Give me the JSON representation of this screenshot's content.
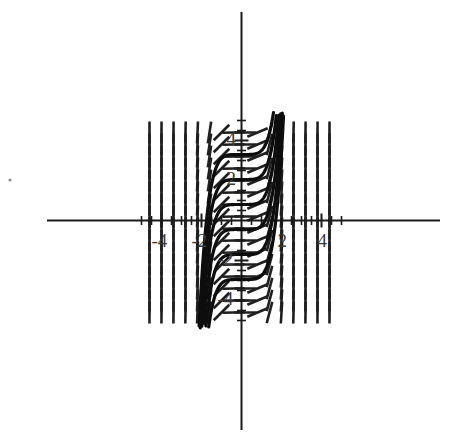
{
  "figure": {
    "title": "",
    "background_color": "#ffffff",
    "ink_color": "#1a1a1a",
    "curve_color": "#0d0d0d",
    "label_color": "#3a3a3a"
  },
  "chart_data": {
    "type": "line",
    "title": "",
    "subtitle": "",
    "xlabel": "",
    "ylabel": "",
    "xlim": [
      -5,
      5
    ],
    "ylim": [
      -5,
      5
    ],
    "grid": false,
    "legend": null,
    "legend_position": "none",
    "x_ticks_major": [
      -4,
      -2,
      2,
      4
    ],
    "x_tick_labels": [
      "-4",
      "-2",
      "2",
      "4"
    ],
    "y_ticks_major": [
      -4,
      -2,
      2,
      4
    ],
    "y_tick_labels": [
      "-4",
      "-2",
      "2",
      "4"
    ],
    "x_ticks_minor": [
      -5,
      -4.5,
      -4,
      -3.5,
      -3,
      -2.5,
      -2,
      -1.5,
      -1,
      -0.5,
      0.5,
      1,
      1.5,
      2,
      2.5,
      3,
      3.5,
      4,
      4.5,
      5
    ],
    "y_ticks_minor": [
      -5,
      -4.5,
      -4,
      -3.5,
      -3,
      -2.5,
      -2,
      -1.5,
      -1,
      -0.5,
      0.5,
      1,
      1.5,
      2,
      2.5,
      3,
      3.5,
      4,
      4.5,
      5
    ],
    "slope_rule": "dy/dx = x^4",
    "slope_field": {
      "x_samples": [
        -4.6,
        -4.0,
        -3.4,
        -2.8,
        -2.2,
        -1.6,
        -1.0,
        -0.4,
        0.2,
        0.8,
        1.4,
        2.0,
        2.6,
        3.2,
        3.8,
        4.4
      ],
      "y_samples": [
        -4.6,
        -4.0,
        -3.4,
        -2.8,
        -2.2,
        -1.6,
        -1.0,
        -0.4,
        0.2,
        0.8,
        1.4,
        2.0,
        2.6,
        3.2,
        3.8,
        4.4
      ],
      "slopes_by_x": [
        447.7,
        256.0,
        133.6,
        61.5,
        23.4,
        6.55,
        1.0,
        0.026,
        0.0016,
        0.41,
        3.84,
        16.0,
        45.7,
        104.9,
        208.5,
        375.2
      ],
      "segment_length_px": 22
    },
    "series": [
      {
        "name": "solution-curve-1",
        "c": 3.3,
        "values_note": "y = x^5/5 + 3.30"
      },
      {
        "name": "solution-curve-2",
        "c": 2.05,
        "values_note": "y = x^5/5 + 2.05"
      },
      {
        "name": "solution-curve-3",
        "c": 0.8,
        "values_note": "y = x^5/5 + 0.80"
      },
      {
        "name": "solution-curve-4",
        "c": -0.45,
        "values_note": "y = x^5/5 - 0.45"
      },
      {
        "name": "solution-curve-5",
        "c": -1.7,
        "values_note": "y = x^5/5 - 1.70"
      },
      {
        "name": "solution-curve-6",
        "c": -2.95,
        "values_note": "y = x^5/5 - 2.95"
      }
    ]
  },
  "axes": {
    "x_axis_name": "x-axis",
    "y_axis_name": "y-axis",
    "origin_label": ""
  },
  "artifacts": {
    "speck_note": "scan speck"
  }
}
